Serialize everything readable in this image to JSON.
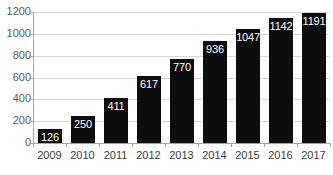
{
  "chart_data": {
    "type": "bar",
    "title": "",
    "subtitle": "",
    "xlabel": "",
    "ylabel": "",
    "categories": [
      "2009",
      "2010",
      "2011",
      "2012",
      "2013",
      "2014",
      "2015",
      "2016",
      "2017"
    ],
    "values": [
      126,
      250,
      411,
      617,
      770,
      936,
      1047,
      1142,
      1191
    ],
    "data_labels": [
      "126",
      "250",
      "411",
      "617",
      "770",
      "936",
      "1047",
      "1142",
      "1191"
    ],
    "ylim": [
      0,
      1200
    ],
    "yticks": [
      0,
      200,
      400,
      600,
      800,
      1000,
      1200
    ],
    "ytick_labels": [
      "0",
      "200",
      "400",
      "600",
      "800",
      "1000",
      "1200"
    ],
    "grid": true,
    "grid_axis": "y",
    "legend": false,
    "legend_position": "none",
    "series": [
      {
        "name": "",
        "values": [
          126,
          250,
          411,
          617,
          770,
          936,
          1047,
          1142,
          1191
        ]
      }
    ],
    "colors": {
      "bar": "#0d0d0d",
      "data_label": "#ffffff",
      "gridline": "#d9d9d9",
      "axis_line": "#a6a6a6",
      "tick_label": "#5a5a5a",
      "category_label": "#3d3d3d",
      "background": "#ffffff"
    }
  }
}
